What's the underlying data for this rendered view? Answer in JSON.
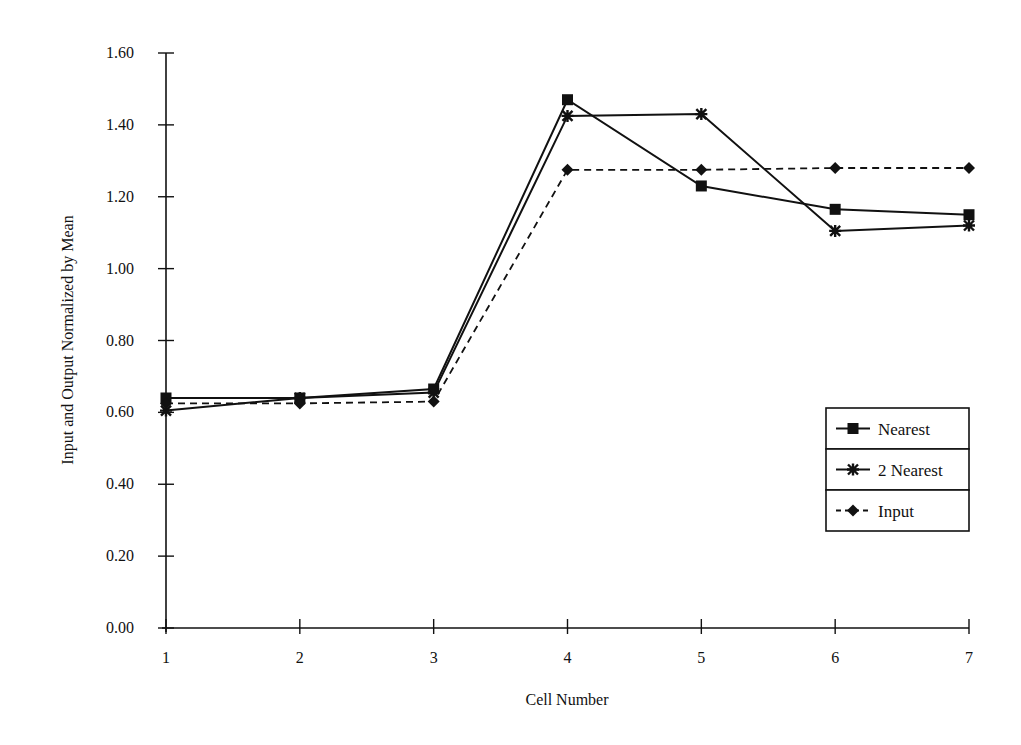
{
  "chart_data": {
    "type": "line",
    "title": "",
    "xlabel": "Cell Number",
    "ylabel": "Input and Output Normalized by Mean",
    "x": [
      1,
      2,
      3,
      4,
      5,
      6,
      7
    ],
    "x_tick_labels": [
      "1",
      "2",
      "3",
      "4",
      "5",
      "6",
      "7"
    ],
    "y_tick_labels": [
      "0.00",
      "0.20",
      "0.40",
      "0.60",
      "0.80",
      "1.00",
      "1.20",
      "1.40",
      "1.60"
    ],
    "ylim": [
      0,
      1.6
    ],
    "xlim": [
      1,
      7
    ],
    "grid": false,
    "legend_position": "lower right (inside plot)",
    "series": [
      {
        "name": "Nearest",
        "marker": "square",
        "line": "solid",
        "values": [
          0.64,
          0.64,
          0.665,
          1.47,
          1.23,
          1.165,
          1.15
        ]
      },
      {
        "name": "2 Nearest",
        "marker": "star",
        "line": "solid",
        "values": [
          0.605,
          0.64,
          0.655,
          1.425,
          1.43,
          1.105,
          1.12
        ]
      },
      {
        "name": "Input",
        "marker": "diamond",
        "line": "dashed",
        "values": [
          0.625,
          0.625,
          0.63,
          1.275,
          1.275,
          1.28,
          1.28
        ]
      }
    ]
  },
  "colors": {
    "ink": "#111111",
    "background": "#ffffff"
  }
}
